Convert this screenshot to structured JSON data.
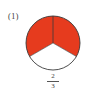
{
  "problem": {
    "label": "(1)",
    "fraction": {
      "numerator": "2",
      "denominator": "3"
    },
    "circle": {
      "parts": 3,
      "shaded_parts": 2,
      "shaded_color": "#E63B1E",
      "unshaded_color": "#FFFFFF",
      "outline_color": "#3A3A3A"
    }
  }
}
